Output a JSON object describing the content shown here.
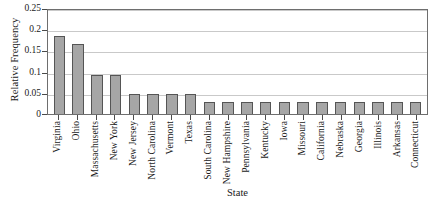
{
  "chart_data": {
    "type": "bar",
    "title": "",
    "xlabel": "State",
    "ylabel": "Relative Frequency",
    "ylim": [
      0,
      0.25
    ],
    "yticks": [
      0,
      0.05,
      0.1,
      0.15,
      0.2,
      0.25
    ],
    "ytick_labels": [
      "0",
      "0.05",
      "0.1",
      "0.15",
      "0.2",
      "0.25"
    ],
    "grid": "horizontal",
    "legend": "none",
    "categories": [
      "Virginia",
      "Ohio",
      "Massachusetts",
      "New York",
      "New Jersey",
      "North Carolina",
      "Vermont",
      "Texas",
      "South Carolina",
      "New Hampshire",
      "Pennsylvania",
      "Kentucky",
      "Iowa",
      "Missouri",
      "California",
      "Nebraska",
      "Georgia",
      "Illinois",
      "Arkansas",
      "Connecticut"
    ],
    "values": [
      0.185,
      0.166,
      0.093,
      0.093,
      0.047,
      0.047,
      0.047,
      0.047,
      0.028,
      0.028,
      0.028,
      0.028,
      0.028,
      0.028,
      0.028,
      0.028,
      0.028,
      0.028,
      0.028,
      0.028
    ]
  },
  "style": {
    "bar_fill": "#a6a6a6",
    "bar_border": "#555555",
    "grid_color": "#c9c9c9",
    "frame_color": "#6e6e6e",
    "text_color": "#1a1a1a",
    "background": "#ffffff"
  }
}
